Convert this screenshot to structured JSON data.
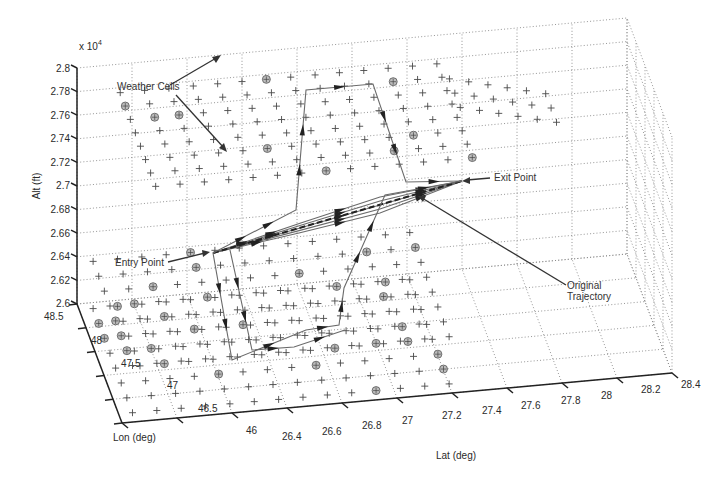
{
  "chart_data": {
    "type": "scatter",
    "subtype": "3d-trajectory",
    "title": "",
    "xlabel": "Lat (deg)",
    "ylabel": "Lon (deg)",
    "zlabel": "Alt (ft)",
    "z_multiplier": "x 10",
    "z_multiplier_exp": "4",
    "xlim": [
      26.4,
      28.4
    ],
    "ylim": [
      46,
      48.5
    ],
    "zlim": [
      2.6,
      2.8
    ],
    "x_ticks": [
      "26.4",
      "26.6",
      "26.8",
      "27",
      "27.2",
      "27.4",
      "27.6",
      "27.8",
      "28",
      "28.2",
      "28.4"
    ],
    "y_ticks": [
      "46",
      "46.5",
      "47",
      "47.5",
      "48",
      "48.5"
    ],
    "z_ticks": [
      "2.6",
      "2.62",
      "2.64",
      "2.66",
      "2.68",
      "2.7",
      "2.72",
      "2.74",
      "2.76",
      "2.78",
      "2.8"
    ],
    "grid": true,
    "series": [
      {
        "name": "Grid nodes",
        "marker": "+",
        "layers_alt_x1e4": [
          2.64,
          2.64,
          2.6
        ]
      },
      {
        "name": "Weather Cells",
        "marker": "circled-plus"
      },
      {
        "name": "Original Trajectory",
        "from": "Entry Point",
        "to": "Exit Point",
        "alt_x1e4": 2.64
      },
      {
        "name": "Rerouted trajectories",
        "alt_range_x1e4": [
          2.6,
          2.78
        ],
        "arrows": true
      }
    ],
    "annotations": [
      "Weather Cells",
      "Entry Point",
      "Exit Point",
      "Original Trajectory"
    ]
  },
  "labels": {
    "zlabel": "Alt (ft)",
    "xlabel": "Lat (deg)",
    "ylabel": "Lon (deg)",
    "zmult": "x 10",
    "zmult_exp": "4"
  },
  "annotations": {
    "weather_cells": "Weather Cells",
    "entry_point": "Entry Point",
    "exit_point": "Exit Point",
    "original_1": "Original",
    "original_2": "Trajectory"
  },
  "ticks": {
    "z": [
      "2.8",
      "2.78",
      "2.76",
      "2.74",
      "2.72",
      "2.7",
      "2.68",
      "2.66",
      "2.64",
      "2.62",
      "2.6"
    ],
    "lon": [
      "48.5",
      "48",
      "47.5",
      "47",
      "46.5",
      "46"
    ],
    "lat": [
      "26.4",
      "26.6",
      "26.8",
      "27",
      "27.2",
      "27.4",
      "27.6",
      "27.8",
      "28",
      "28.2",
      "28.4"
    ]
  }
}
